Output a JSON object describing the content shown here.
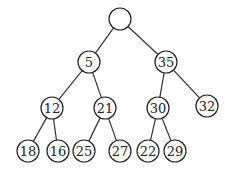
{
  "tree": {
    "radius": 11,
    "nodes": [
      {
        "id": "root",
        "label": "",
        "x": 120,
        "y": 19
      },
      {
        "id": "n5",
        "label": "5",
        "x": 89,
        "y": 62
      },
      {
        "id": "n35",
        "label": "35",
        "x": 166,
        "y": 62
      },
      {
        "id": "n12",
        "label": "12",
        "x": 52,
        "y": 108
      },
      {
        "id": "n21",
        "label": "21",
        "x": 105,
        "y": 108
      },
      {
        "id": "n30",
        "label": "30",
        "x": 158,
        "y": 108
      },
      {
        "id": "n32",
        "label": "32",
        "x": 207,
        "y": 106
      },
      {
        "id": "n18",
        "label": "18",
        "x": 28,
        "y": 151
      },
      {
        "id": "n16",
        "label": "16",
        "x": 58,
        "y": 151
      },
      {
        "id": "n25",
        "label": "25",
        "x": 84,
        "y": 151
      },
      {
        "id": "n27",
        "label": "27",
        "x": 120,
        "y": 151
      },
      {
        "id": "n22",
        "label": "22",
        "x": 148,
        "y": 151
      },
      {
        "id": "n29",
        "label": "29",
        "x": 175,
        "y": 151
      }
    ],
    "edges": [
      [
        "root",
        "n5"
      ],
      [
        "root",
        "n35"
      ],
      [
        "n5",
        "n12"
      ],
      [
        "n5",
        "n21"
      ],
      [
        "n35",
        "n30"
      ],
      [
        "n35",
        "n32"
      ],
      [
        "n12",
        "n18"
      ],
      [
        "n12",
        "n16"
      ],
      [
        "n21",
        "n25"
      ],
      [
        "n21",
        "n27"
      ],
      [
        "n30",
        "n22"
      ],
      [
        "n30",
        "n29"
      ]
    ]
  }
}
